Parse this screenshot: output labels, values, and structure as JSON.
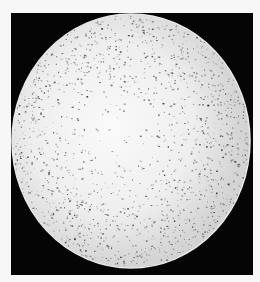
{
  "image": {
    "description": "Grayscale halftone photograph of a speckled circular disc on a black square background",
    "subject": "speckled-disc",
    "colors": {
      "page_background": "#f7f7f7",
      "frame_background": "#050505",
      "disc_light": "#f4f4f4",
      "disc_speckle": "#3a3a3a"
    }
  }
}
